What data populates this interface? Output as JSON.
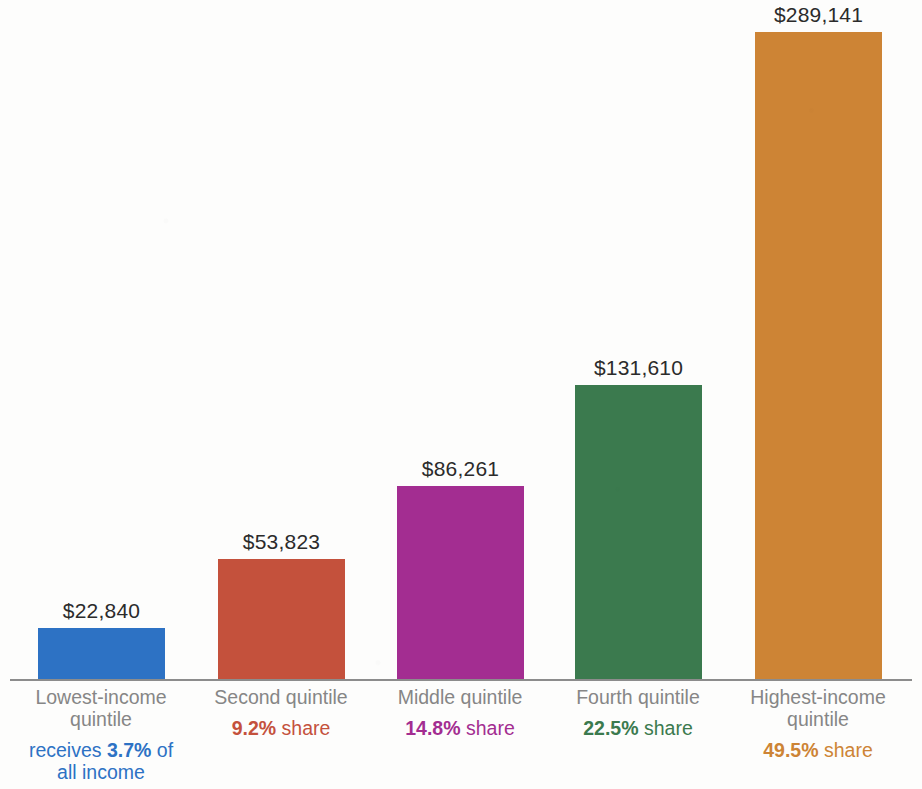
{
  "chart_data": {
    "type": "bar",
    "title": "",
    "subtitle": "",
    "xlabel": "",
    "ylabel": "",
    "ylim": [
      0,
      289141
    ],
    "grid": false,
    "legend_position": "none",
    "categories": [
      "Lowest-income quintile",
      "Second quintile",
      "Middle quintile",
      "Fourth quintile",
      "Highest-income quintile"
    ],
    "values": [
      22840,
      53823,
      86261,
      131610,
      289141
    ],
    "value_labels": [
      "$22,840",
      "$53,823",
      "$86,261",
      "$131,610",
      "$289,141"
    ],
    "share_values": [
      3.7,
      9.2,
      14.8,
      22.5,
      49.5
    ],
    "colors": [
      "#2d72c4",
      "#c4513c",
      "#a32d91",
      "#3b7a4e",
      "#cd8435"
    ]
  },
  "bars": [
    {
      "category_line1": "Lowest-income",
      "category_line2": "quintile",
      "value_label": "$22,840",
      "value": 22840,
      "share_prefix": "receives ",
      "share_pct": "3.7%",
      "share_suffix": " of",
      "share_line2": "all income",
      "color": "#2d72c4",
      "share_color": "#2d72c4"
    },
    {
      "category_line1": "Second quintile",
      "category_line2": "",
      "value_label": "$53,823",
      "value": 53823,
      "share_prefix": "",
      "share_pct": "9.2%",
      "share_suffix": " share",
      "share_line2": "",
      "color": "#c4513c",
      "share_color": "#c4513c"
    },
    {
      "category_line1": "Middle quintile",
      "category_line2": "",
      "value_label": "$86,261",
      "value": 86261,
      "share_prefix": "",
      "share_pct": "14.8%",
      "share_suffix": " share",
      "share_line2": "",
      "color": "#a32d91",
      "share_color": "#a32d91"
    },
    {
      "category_line1": "Fourth quintile",
      "category_line2": "",
      "value_label": "$131,610",
      "value": 131610,
      "share_prefix": "",
      "share_pct": "22.5%",
      "share_suffix": " share",
      "share_line2": "",
      "color": "#3b7a4e",
      "share_color": "#3b7a4e"
    },
    {
      "category_line1": "Highest-income",
      "category_line2": "quintile",
      "value_label": "$289,141",
      "value": 289141,
      "share_prefix": "",
      "share_pct": "49.5%",
      "share_suffix": " share",
      "share_line2": "",
      "color": "#cd8435",
      "share_color": "#cd8435"
    }
  ],
  "layout": {
    "bar_left_positions": [
      38,
      218,
      397,
      575,
      755
    ],
    "column_left_positions": [
      8,
      188,
      367,
      545,
      725
    ],
    "bar_width": 127,
    "baseline_y": 679,
    "max_bar_height": 647,
    "axis_color": "#8c8c8c"
  }
}
